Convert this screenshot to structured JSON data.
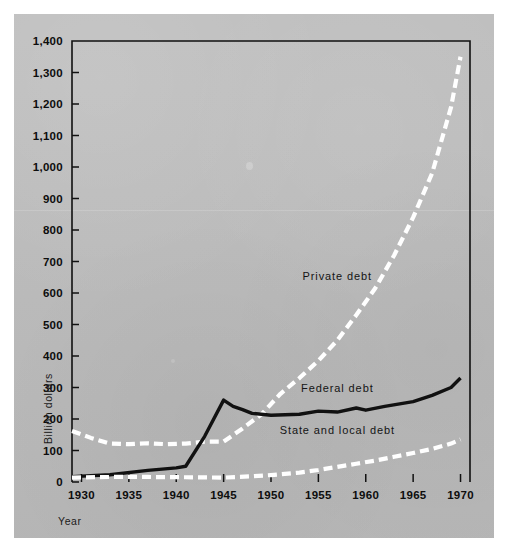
{
  "figure": {
    "background_color": "#bcbcbc",
    "line_color_solid": "#111111",
    "line_color_dashed": "#ffffff",
    "axis_color": "#111111"
  },
  "chart_data": {
    "type": "line",
    "title": "",
    "xlabel": "Year",
    "ylabel": "Billion dollars",
    "xlim": [
      1929,
      1971
    ],
    "ylim": [
      0,
      1400
    ],
    "xticks": [
      1930,
      1935,
      1940,
      1945,
      1950,
      1955,
      1960,
      1965,
      1970
    ],
    "xtick_labels": [
      "1930",
      "1935",
      "1940",
      "1945",
      "1950",
      "1955",
      "1960",
      "1965",
      "1970"
    ],
    "yticks": [
      0,
      100,
      200,
      300,
      400,
      500,
      600,
      700,
      800,
      900,
      1000,
      1100,
      1200,
      1300,
      1400
    ],
    "ytick_labels": [
      "0",
      "100",
      "200",
      "300",
      "400",
      "500",
      "600",
      "700",
      "800",
      "900",
      "1,000",
      "1,100",
      "1,200",
      "1,300",
      "1,400"
    ],
    "grid": false,
    "legend_position": "inline-annotations",
    "series": [
      {
        "name": "Private debt",
        "style": "dashed",
        "color": "#ffffff",
        "label_x": 1957,
        "label_y": 640,
        "x": [
          1929,
          1931,
          1933,
          1935,
          1937,
          1939,
          1941,
          1943,
          1945,
          1947,
          1949,
          1951,
          1953,
          1955,
          1957,
          1959,
          1961,
          1963,
          1965,
          1967,
          1969,
          1970
        ],
        "values": [
          162,
          140,
          122,
          120,
          123,
          120,
          122,
          128,
          128,
          170,
          215,
          280,
          330,
          385,
          450,
          530,
          615,
          720,
          840,
          980,
          1190,
          1350
        ]
      },
      {
        "name": "Federal debt",
        "style": "solid",
        "color": "#111111",
        "label_x": 1957,
        "label_y": 285,
        "x": [
          1929,
          1933,
          1937,
          1940,
          1941,
          1943,
          1945,
          1946,
          1947,
          1948,
          1950,
          1953,
          1955,
          1957,
          1959,
          1960,
          1962,
          1965,
          1967,
          1969,
          1970
        ],
        "values": [
          17,
          23,
          37,
          45,
          50,
          145,
          260,
          240,
          230,
          218,
          212,
          215,
          225,
          222,
          235,
          228,
          240,
          255,
          275,
          300,
          330
        ]
      },
      {
        "name": "State and local debt",
        "style": "dashed",
        "color": "#ffffff",
        "label_x": 1957,
        "label_y": 152,
        "x": [
          1929,
          1933,
          1937,
          1941,
          1945,
          1948,
          1950,
          1953,
          1955,
          1957,
          1959,
          1961,
          1963,
          1965,
          1967,
          1969,
          1970
        ],
        "values": [
          14,
          16,
          16,
          15,
          14,
          18,
          22,
          30,
          38,
          48,
          58,
          68,
          80,
          92,
          105,
          122,
          135
        ]
      }
    ]
  }
}
